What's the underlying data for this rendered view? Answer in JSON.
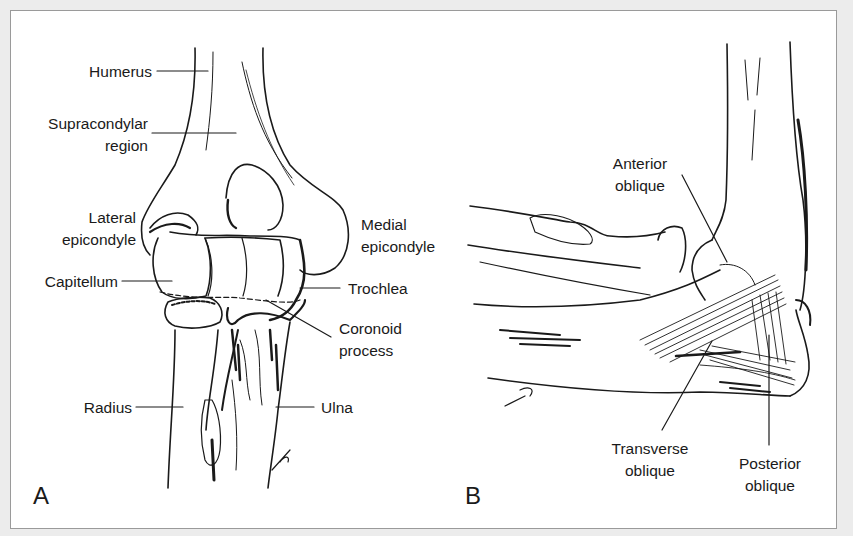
{
  "figure": {
    "panels": [
      {
        "letter": "A",
        "view": "anterior bony anatomy",
        "labels": {
          "humerus": "Humerus",
          "supracondylar_1": "Supracondylar",
          "supracondylar_2": "region",
          "lateral_1": "Lateral",
          "lateral_2": "epicondyle",
          "medial_1": "Medial",
          "medial_2": "epicondyle",
          "capitellum": "Capitellum",
          "trochlea": "Trochlea",
          "coronoid_1": "Coronoid",
          "coronoid_2": "process",
          "radius": "Radius",
          "ulna": "Ulna"
        }
      },
      {
        "letter": "B",
        "view": "medial collateral ligament complex",
        "labels": {
          "anterior_1": "Anterior",
          "anterior_2": "oblique",
          "transverse_1": "Transverse",
          "transverse_2": "oblique",
          "posterior_1": "Posterior",
          "posterior_2": "oblique"
        }
      }
    ],
    "colors": {
      "background": "#ececec",
      "frame_fill": "#ffffff",
      "frame_border": "#9a9a9a",
      "ink": "#1a1a1a"
    }
  }
}
